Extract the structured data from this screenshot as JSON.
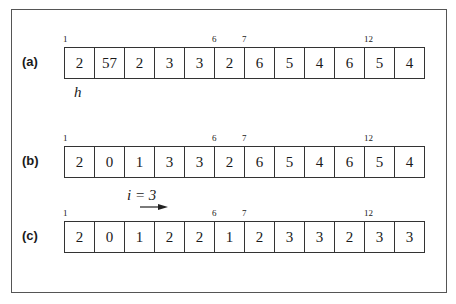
{
  "figure": {
    "rows": [
      {
        "label": "(a)",
        "cells": [
          "2",
          "57",
          "2",
          "3",
          "3",
          "2",
          "6",
          "5",
          "4",
          "6",
          "5",
          "4"
        ],
        "indices": {
          "first": "1",
          "mid1": "6",
          "mid2": "7",
          "last": "12"
        },
        "annotation": "h"
      },
      {
        "label": "(b)",
        "cells": [
          "2",
          "0",
          "1",
          "3",
          "3",
          "2",
          "6",
          "5",
          "4",
          "6",
          "5",
          "4"
        ],
        "indices": {
          "first": "1",
          "mid1": "6",
          "mid2": "7",
          "last": "12"
        },
        "annotation": "i = 3"
      },
      {
        "label": "(c)",
        "cells": [
          "2",
          "0",
          "1",
          "2",
          "2",
          "1",
          "2",
          "3",
          "3",
          "2",
          "3",
          "3"
        ],
        "indices": {
          "first": "1",
          "mid1": "6",
          "mid2": "7",
          "last": "12"
        }
      }
    ]
  }
}
